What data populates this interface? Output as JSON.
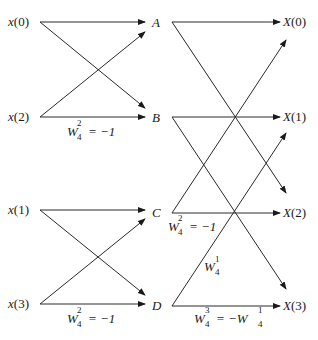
{
  "diagram": {
    "type": "4-point radix-2 DIT FFT butterfly flow graph",
    "inputs": [
      {
        "id": "x0",
        "prefix": "x",
        "index": "0"
      },
      {
        "id": "x2",
        "prefix": "x",
        "index": "2"
      },
      {
        "id": "x1",
        "prefix": "x",
        "index": "1"
      },
      {
        "id": "x3",
        "prefix": "x",
        "index": "3"
      }
    ],
    "intermediates": [
      "A",
      "B",
      "C",
      "D"
    ],
    "outputs": [
      {
        "id": "X0",
        "prefix": "X",
        "index": "0"
      },
      {
        "id": "X1",
        "prefix": "X",
        "index": "1"
      },
      {
        "id": "X2",
        "prefix": "X",
        "index": "2"
      },
      {
        "id": "X3",
        "prefix": "X",
        "index": "3"
      }
    ],
    "twiddles": {
      "stage1_top": {
        "base": "W",
        "sub": "4",
        "sup": "2",
        "rhs": "= −1"
      },
      "stage1_bottom": {
        "base": "W",
        "sub": "4",
        "sup": "2",
        "rhs": "= −1"
      },
      "stage2_C": {
        "base": "W",
        "sub": "4",
        "sup": "2",
        "rhs": "= −1"
      },
      "stage2_diag": {
        "base": "W",
        "sub": "4",
        "sup": "1",
        "rhs": ""
      },
      "stage2_D": {
        "base": "W",
        "sub": "4",
        "sup": "3",
        "rhs": "= −W",
        "rhs_sub": "4",
        "rhs_sup": "1"
      }
    }
  }
}
